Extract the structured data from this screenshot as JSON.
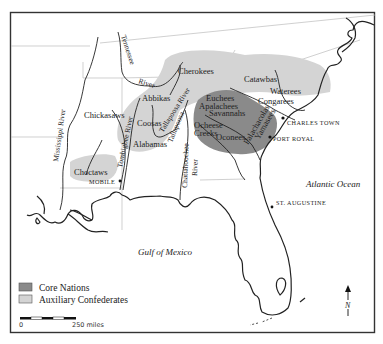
{
  "colors": {
    "core": "#8a8a8a",
    "auxiliary": "#d4d4d4",
    "ink": "#222222",
    "frame": "#333333",
    "state_border": "#bbbbbb"
  },
  "regions": {
    "auxiliary": [
      "Cherokees",
      "Catawbas",
      "Waterees",
      "Congarees",
      "Abbikas",
      "Coosas",
      "Alabamas",
      "Choctaws"
    ],
    "core": [
      "Euchees",
      "Apalachees",
      "Savannahs",
      "Ocheese Creeks",
      "Oconees",
      "Palachacolas",
      "Yamasees"
    ]
  },
  "tribes": {
    "cherokees": "Cherokees",
    "catawbas": "Catawbas",
    "waterees": "Waterees",
    "congarees": "Congarees",
    "euchees": "Euchees",
    "apalachees": "Apalachees",
    "savannahs": "Savannahs",
    "ocheese": "Ocheese",
    "creeks": "Creeks",
    "oconees": "Oconees",
    "palachacolas": "Palachacolas",
    "yamasees": "Yamasees",
    "chickasaws": "Chickasaws",
    "abbikas": "Abbikas",
    "coosas": "Coosas",
    "alabamas": "Alabamas",
    "choctaws": "Choctaws"
  },
  "rivers": {
    "tennessee": "Tennessee",
    "river_suffix": "River",
    "mississippi": "Mississippi River",
    "tombigbee": "Tombigbee River",
    "tallapoosa_river": "Tallapoosa River",
    "tallapoosa": "Tallapoosa",
    "chattahoochee": "Chattahoochee",
    "chattahoochee_river": "River"
  },
  "cities": {
    "charles_town": "Charles Town",
    "port_royal": "Port Royal",
    "mobile": "Mobile",
    "st_augustine": "St. Augustine"
  },
  "water_bodies": {
    "atlantic": "Atlantic Ocean",
    "gulf": "Gulf of Mexico"
  },
  "legend": {
    "core_label": "Core Nations",
    "auxiliary_label": "Auxiliary Confederates"
  },
  "scale": {
    "start_label": "0",
    "end_label": "250 miles"
  },
  "compass": {
    "label": "N"
  }
}
